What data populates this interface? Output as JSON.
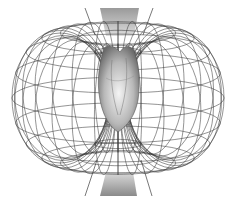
{
  "figure": {
    "title": "Heart electromagnetic field (toroidal)",
    "elements": {
      "torus": "toroidal-field-lines",
      "heart": "heart",
      "top_beam": "upper-conical-beam",
      "bottom_beam": "lower-conical-beam"
    },
    "colors": {
      "background": "#ffffff",
      "wire": "#3a3a3a",
      "heart_light": "#e8e8e8",
      "heart_dark": "#6a6a6a",
      "beam_dark": "#8a8a8a",
      "beam_light": "#d8d8d8"
    }
  }
}
